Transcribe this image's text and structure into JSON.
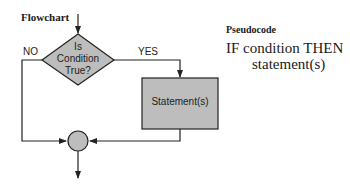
{
  "flowchart": {
    "title": "Flowchart",
    "decision": {
      "line1": "Is",
      "line2": "Condition",
      "line3": "True?"
    },
    "no_label": "NO",
    "yes_label": "YES",
    "statement": "Statement(s)",
    "colors": {
      "fill": "#bdbdbd",
      "stroke": "#222222",
      "line": "#222222"
    }
  },
  "pseudocode": {
    "title": "Pseudocode",
    "line1": "IF condition THEN",
    "line2": "statement(s)"
  }
}
